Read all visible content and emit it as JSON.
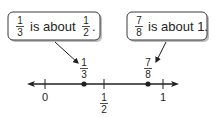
{
  "diagram": {
    "type": "number-line-with-callouts",
    "colors": {
      "ink": "#231f20",
      "callout_border": "#3a3a3a",
      "callout_shadow": "#bdbdbd",
      "background": "#ffffff"
    },
    "callouts": [
      {
        "fraction": {
          "num": "1",
          "den": "3"
        },
        "text": "is about",
        "target_fraction": {
          "num": "1",
          "den": "2"
        },
        "end": "."
      },
      {
        "fraction": {
          "num": "7",
          "den": "8"
        },
        "text": "is about 1.",
        "target_fraction": null,
        "end": ""
      }
    ],
    "number_line": {
      "ticks": [
        {
          "label": "0",
          "value": 0
        },
        {
          "label_num": "1",
          "label_den": "2",
          "value": 0.5
        },
        {
          "label": "1",
          "value": 1
        }
      ],
      "points": [
        {
          "label_num": "1",
          "label_den": "3",
          "value": 0.3333
        },
        {
          "label_num": "7",
          "label_den": "8",
          "value": 0.875
        }
      ]
    }
  }
}
